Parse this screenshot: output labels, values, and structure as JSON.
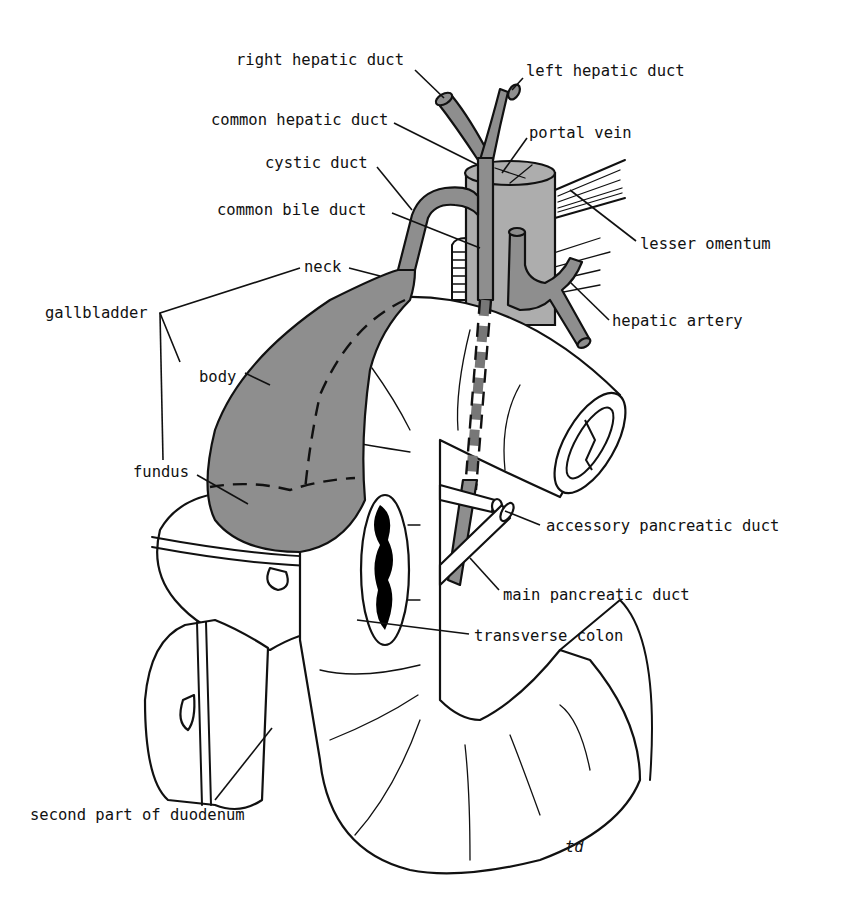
{
  "figure": {
    "type": "anatomical line drawing",
    "colors": {
      "background": "#ffffff",
      "outline": "#111111",
      "biliary_fill": "#8e8e8e",
      "portal_vein_fill": "#adadad",
      "lumen_fill": "#000000"
    },
    "signature": "td"
  },
  "labels": {
    "right_hepatic_duct": "right hepatic duct",
    "left_hepatic_duct": "left hepatic duct",
    "common_hepatic_duct": "common hepatic duct",
    "portal_vein": "portal vein",
    "cystic_duct": "cystic duct",
    "common_bile_duct": "common bile duct",
    "lesser_omentum": "lesser omentum",
    "neck": "neck",
    "gallbladder": "gallbladder",
    "hepatic_artery": "hepatic artery",
    "body": "body",
    "fundus": "fundus",
    "accessory_pancreatic_duct": "accessory pancreatic duct",
    "main_pancreatic_duct": "main pancreatic duct",
    "transverse_colon": "transverse colon",
    "second_part_of_duodenum": "second part of duodenum"
  }
}
